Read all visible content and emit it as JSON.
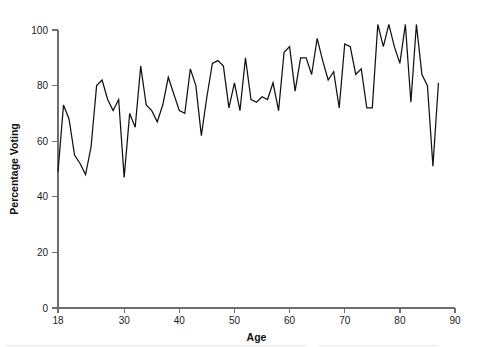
{
  "chart_data": {
    "type": "line",
    "title": "",
    "subtitle": "",
    "xlabel": "Age",
    "ylabel": "Percentage Voting",
    "xlim": [
      18,
      90
    ],
    "ylim": [
      0,
      104
    ],
    "grid": false,
    "legend": null,
    "line_color": "#111111",
    "axis_color": "#6e6e6e",
    "xticks": [
      18,
      30,
      40,
      50,
      60,
      70,
      80,
      90
    ],
    "xtick_labels": [
      "18",
      "30",
      "40",
      "50",
      "60",
      "70",
      "80",
      "90"
    ],
    "yticks": [
      0,
      20,
      40,
      60,
      80,
      100
    ],
    "ytick_labels": [
      "0",
      "20",
      "40",
      "60",
      "80",
      "100"
    ],
    "x": [
      18,
      19,
      20,
      21,
      22,
      23,
      24,
      25,
      26,
      27,
      28,
      29,
      30,
      31,
      32,
      33,
      34,
      35,
      36,
      37,
      38,
      39,
      40,
      41,
      42,
      43,
      44,
      45,
      46,
      47,
      48,
      49,
      50,
      51,
      52,
      53,
      54,
      55,
      56,
      57,
      58,
      59,
      60,
      61,
      62,
      63,
      64,
      65,
      66,
      67,
      68,
      69,
      70,
      71,
      72,
      73,
      74,
      75,
      76,
      77,
      78,
      79,
      80,
      81,
      82,
      83,
      84,
      85,
      86,
      87
    ],
    "values": [
      49,
      73,
      68,
      55,
      52,
      48,
      58,
      80,
      82,
      75,
      71,
      75,
      47,
      70,
      65,
      87,
      73,
      71,
      67,
      73,
      83,
      77,
      71,
      70,
      86,
      80,
      62,
      76,
      88,
      89,
      87,
      72,
      81,
      71,
      90,
      75,
      74,
      76,
      75,
      81,
      71,
      92,
      94,
      78,
      90,
      90,
      84,
      97,
      89,
      82,
      85,
      72,
      95,
      94,
      84,
      86,
      72,
      72,
      102,
      94,
      102,
      94,
      88,
      102,
      74,
      102,
      84,
      80,
      51,
      81
    ],
    "series": [
      {
        "name": "Percentage Voting",
        "values": [
          49,
          73,
          68,
          55,
          52,
          48,
          58,
          80,
          82,
          75,
          71,
          75,
          47,
          70,
          65,
          87,
          73,
          71,
          67,
          73,
          83,
          77,
          71,
          70,
          86,
          80,
          62,
          76,
          88,
          89,
          87,
          72,
          81,
          71,
          90,
          75,
          74,
          76,
          75,
          81,
          71,
          92,
          94,
          78,
          90,
          90,
          84,
          97,
          89,
          82,
          85,
          72,
          95,
          94,
          84,
          86,
          72,
          72,
          102,
          94,
          102,
          94,
          88,
          102,
          74,
          102,
          84,
          80,
          51,
          81
        ]
      }
    ]
  }
}
